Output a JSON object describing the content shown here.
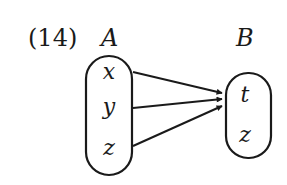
{
  "problem_number": "(14)",
  "set_a": {
    "label": "A",
    "elements": [
      "x",
      "y",
      "z"
    ]
  },
  "set_b": {
    "label": "B",
    "elements": [
      "t",
      "z"
    ]
  },
  "mapping": [
    {
      "from": "x",
      "to": "t"
    },
    {
      "from": "y",
      "to": "t"
    },
    {
      "from": "z",
      "to": "t"
    }
  ]
}
